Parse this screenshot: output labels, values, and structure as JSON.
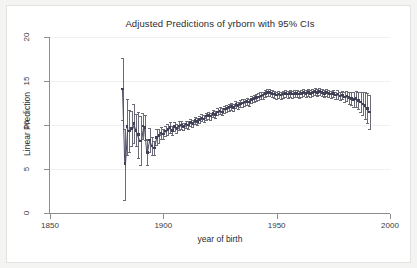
{
  "figure": {
    "title": "Adjusted Predictions of yrborn with 95% CIs",
    "xlabel": "year of birth",
    "ylabel": "Linear Prediction",
    "background": "#f4f4f2",
    "plot_background": "#ffffff",
    "marker_color": "#3f3f55",
    "ci_color": "#6b6b78",
    "axis_color": "#8c8c8c",
    "grid_color": "#f0f0f0"
  },
  "chart_data": {
    "type": "scatter",
    "title": "Adjusted Predictions of yrborn with 95% CIs",
    "subtitle": "",
    "xlabel": "year of birth",
    "ylabel": "Linear Prediction",
    "xlim": [
      1850,
      2000
    ],
    "ylim": [
      0,
      20
    ],
    "xticks": [
      1850,
      1900,
      1950,
      2000
    ],
    "yticks": [
      0,
      5,
      10,
      15,
      20
    ],
    "grid": true,
    "legend": "none",
    "series_name": "Linear Prediction with 95% CI",
    "annotations": [],
    "x": [
      1882,
      1883,
      1884,
      1885,
      1886,
      1887,
      1888,
      1889,
      1890,
      1891,
      1892,
      1893,
      1894,
      1895,
      1896,
      1897,
      1898,
      1899,
      1900,
      1901,
      1902,
      1903,
      1904,
      1905,
      1906,
      1907,
      1908,
      1909,
      1910,
      1911,
      1912,
      1913,
      1914,
      1915,
      1916,
      1917,
      1918,
      1919,
      1920,
      1921,
      1922,
      1923,
      1924,
      1925,
      1926,
      1927,
      1928,
      1929,
      1930,
      1931,
      1932,
      1933,
      1934,
      1935,
      1936,
      1937,
      1938,
      1939,
      1940,
      1941,
      1942,
      1943,
      1944,
      1945,
      1946,
      1947,
      1948,
      1949,
      1950,
      1951,
      1952,
      1953,
      1954,
      1955,
      1956,
      1957,
      1958,
      1959,
      1960,
      1961,
      1962,
      1963,
      1964,
      1965,
      1966,
      1967,
      1968,
      1969,
      1970,
      1971,
      1972,
      1973,
      1974,
      1975,
      1976,
      1977,
      1978,
      1979,
      1980,
      1981,
      1982,
      1983,
      1984,
      1985,
      1986,
      1987,
      1988,
      1989,
      1990,
      1991
    ],
    "y": [
      14.1,
      5.6,
      9.8,
      9.3,
      9.6,
      10.2,
      9.4,
      8.9,
      8.2,
      9.9,
      9.7,
      6.9,
      8.3,
      7.6,
      7.4,
      8.6,
      8.8,
      9.1,
      9.0,
      9.3,
      9.5,
      9.7,
      9.4,
      9.8,
      9.6,
      9.9,
      10.0,
      9.8,
      10.1,
      10.0,
      10.3,
      10.2,
      10.5,
      10.4,
      10.6,
      10.8,
      10.7,
      11.0,
      11.1,
      11.0,
      11.3,
      11.2,
      11.5,
      11.6,
      11.5,
      11.8,
      11.9,
      12.0,
      12.1,
      12.0,
      12.3,
      12.2,
      12.4,
      12.5,
      12.6,
      12.7,
      12.6,
      12.9,
      13.0,
      13.1,
      13.2,
      13.3,
      13.4,
      13.6,
      13.7,
      13.7,
      13.6,
      13.5,
      13.4,
      13.5,
      13.4,
      13.5,
      13.6,
      13.5,
      13.6,
      13.5,
      13.6,
      13.6,
      13.5,
      13.6,
      13.7,
      13.6,
      13.7,
      13.6,
      13.7,
      13.8,
      13.7,
      13.8,
      13.7,
      13.6,
      13.7,
      13.6,
      13.5,
      13.6,
      13.4,
      13.5,
      13.3,
      13.4,
      13.2,
      13.3,
      13.1,
      13.0,
      12.9,
      13.0,
      12.8,
      12.6,
      12.4,
      12.2,
      11.9,
      11.5
    ],
    "ci_lower": [
      10.6,
      1.5,
      6.6,
      6.9,
      7.6,
      8.0,
      7.6,
      6.3,
      5.4,
      8.4,
      8.3,
      5.4,
      6.9,
      6.6,
      6.6,
      7.7,
      8.0,
      8.4,
      8.4,
      8.7,
      8.9,
      9.1,
      8.9,
      9.3,
      9.1,
      9.4,
      9.5,
      9.4,
      9.7,
      9.6,
      9.9,
      9.8,
      10.1,
      10.0,
      10.2,
      10.4,
      10.3,
      10.6,
      10.7,
      10.6,
      10.9,
      10.8,
      11.1,
      11.2,
      11.1,
      11.4,
      11.5,
      11.6,
      11.7,
      11.6,
      11.9,
      11.8,
      12.0,
      12.1,
      12.2,
      12.3,
      12.2,
      12.5,
      12.6,
      12.7,
      12.8,
      12.9,
      13.0,
      13.2,
      13.3,
      13.3,
      13.2,
      13.1,
      13.0,
      13.1,
      13.0,
      13.1,
      13.2,
      13.1,
      13.2,
      13.1,
      13.2,
      13.2,
      13.1,
      13.2,
      13.3,
      13.2,
      13.3,
      13.2,
      13.3,
      13.4,
      13.3,
      13.4,
      13.3,
      13.2,
      13.3,
      13.2,
      13.1,
      13.2,
      13.0,
      13.0,
      12.8,
      12.9,
      12.6,
      12.7,
      12.4,
      12.3,
      12.1,
      12.1,
      11.8,
      11.5,
      11.1,
      10.7,
      10.2,
      9.6
    ],
    "ci_upper": [
      17.6,
      9.6,
      13.0,
      11.7,
      11.6,
      12.4,
      11.2,
      11.5,
      11.0,
      11.4,
      11.1,
      8.4,
      9.7,
      8.6,
      8.2,
      9.5,
      9.6,
      9.8,
      9.6,
      9.9,
      10.1,
      10.3,
      9.9,
      10.3,
      10.1,
      10.4,
      10.5,
      10.2,
      10.5,
      10.4,
      10.7,
      10.6,
      10.9,
      10.8,
      11.0,
      11.2,
      11.1,
      11.4,
      11.5,
      11.4,
      11.7,
      11.6,
      11.9,
      12.0,
      11.9,
      12.2,
      12.3,
      12.4,
      12.5,
      12.4,
      12.7,
      12.6,
      12.8,
      12.9,
      13.0,
      13.1,
      13.0,
      13.3,
      13.4,
      13.5,
      13.6,
      13.7,
      13.8,
      14.0,
      14.1,
      14.1,
      14.0,
      13.9,
      13.8,
      13.9,
      13.8,
      13.9,
      14.0,
      13.9,
      14.0,
      13.9,
      14.0,
      14.0,
      13.9,
      14.0,
      14.1,
      14.0,
      14.1,
      14.0,
      14.1,
      14.2,
      14.1,
      14.2,
      14.1,
      14.0,
      14.1,
      14.0,
      13.9,
      14.0,
      13.8,
      14.0,
      13.8,
      13.9,
      13.8,
      13.9,
      13.8,
      13.7,
      13.7,
      13.9,
      13.8,
      13.7,
      13.7,
      13.7,
      13.6,
      13.4
    ]
  }
}
